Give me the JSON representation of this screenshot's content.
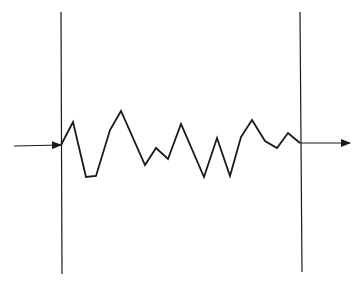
{
  "diagram": {
    "type": "signal-through-medium",
    "colors": {
      "stroke": "#1a1a1a",
      "background": "#ffffff"
    },
    "boundaries": [
      {
        "name": "left-boundary",
        "x1": 61,
        "y1": 12,
        "x2": 62,
        "y2": 274
      },
      {
        "name": "right-boundary",
        "x1": 300,
        "y1": 12,
        "x2": 302,
        "y2": 272
      }
    ],
    "input_arrow": {
      "x1": 14,
      "y1": 146,
      "x2": 61,
      "y2": 145
    },
    "output_arrow": {
      "x1": 300,
      "y1": 143,
      "x2": 350,
      "y2": 143
    },
    "waveform_points": [
      [
        61,
        145
      ],
      [
        73,
        122
      ],
      [
        86,
        177
      ],
      [
        96,
        176
      ],
      [
        110,
        130
      ],
      [
        121,
        111
      ],
      [
        145,
        165
      ],
      [
        156,
        148
      ],
      [
        168,
        159
      ],
      [
        181,
        124
      ],
      [
        204,
        177
      ],
      [
        217,
        138
      ],
      [
        230,
        176
      ],
      [
        241,
        137
      ],
      [
        252,
        120
      ],
      [
        265,
        141
      ],
      [
        277,
        148
      ],
      [
        288,
        133
      ],
      [
        300,
        143
      ]
    ]
  }
}
